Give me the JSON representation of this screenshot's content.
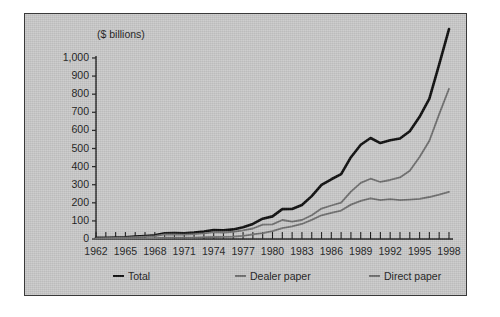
{
  "chart_data": {
    "type": "line",
    "title": "",
    "subtitle": "",
    "unit_label": "($ billions)",
    "xlabel": "",
    "ylabel": "",
    "ylim": [
      0,
      1000
    ],
    "xlim": [
      1962,
      1998
    ],
    "grid": false,
    "legend_position": "bottom",
    "y_ticks": [
      "0",
      "100",
      "200",
      "300",
      "400",
      "500",
      "600",
      "700",
      "800",
      "900",
      "1,000"
    ],
    "y_tick_values": [
      0,
      100,
      200,
      300,
      400,
      500,
      600,
      700,
      800,
      900,
      1000
    ],
    "x_ticks": [
      "1962",
      "1965",
      "1968",
      "1971",
      "1974",
      "1977",
      "1980",
      "1983",
      "1986",
      "1989",
      "1992",
      "1995",
      "1998"
    ],
    "x_tick_values": [
      1962,
      1965,
      1968,
      1971,
      1974,
      1977,
      1980,
      1983,
      1986,
      1989,
      1992,
      1995,
      1998
    ],
    "x": [
      1962,
      1963,
      1964,
      1965,
      1966,
      1967,
      1968,
      1969,
      1970,
      1971,
      1972,
      1973,
      1974,
      1975,
      1976,
      1977,
      1978,
      1979,
      1980,
      1981,
      1982,
      1983,
      1984,
      1985,
      1986,
      1987,
      1988,
      1989,
      1990,
      1991,
      1992,
      1993,
      1994,
      1995,
      1996,
      1997,
      1998
    ],
    "series": [
      {
        "name": "Total",
        "color": "#0d0d0d",
        "width": 2.6,
        "values": [
          6,
          7,
          8,
          9,
          13,
          17,
          21,
          32,
          33,
          32,
          35,
          41,
          49,
          48,
          53,
          65,
          83,
          112,
          125,
          165,
          166,
          188,
          237,
          299,
          330,
          358,
          452,
          521,
          558,
          530,
          546,
          555,
          595,
          675,
          775,
          965,
          1160
        ]
      },
      {
        "name": "Dealer paper",
        "color": "#6e6e6e",
        "width": 1.8,
        "values": [
          2,
          2,
          2,
          2,
          3,
          4,
          5,
          7,
          8,
          8,
          8,
          10,
          11,
          12,
          13,
          17,
          25,
          33,
          44,
          60,
          70,
          83,
          106,
          131,
          145,
          157,
          190,
          211,
          225,
          215,
          220,
          215,
          218,
          222,
          232,
          245,
          260
        ]
      },
      {
        "name": "Direct paper",
        "color": "#6e6e6e",
        "width": 1.8,
        "values": [
          4,
          5,
          6,
          7,
          10,
          13,
          16,
          25,
          25,
          24,
          27,
          31,
          38,
          36,
          40,
          48,
          58,
          79,
          81,
          105,
          96,
          105,
          131,
          168,
          185,
          201,
          262,
          310,
          333,
          315,
          326,
          340,
          377,
          453,
          543,
          690,
          830
        ]
      }
    ]
  },
  "legend": {
    "total_label": "Total",
    "dealer_label": "Dealer paper",
    "direct_label": "Direct paper"
  }
}
